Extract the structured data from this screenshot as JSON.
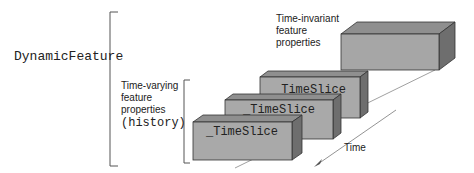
{
  "diagram": {
    "root_label": "DynamicFeature",
    "invariant": {
      "label_lines": [
        "Time-invariant",
        "feature",
        "properties"
      ]
    },
    "varying": {
      "label_lines": [
        "Time-varying",
        "feature",
        "properties"
      ],
      "label_mono": "(history)"
    },
    "timeslices": [
      {
        "label": "_TimeSlice"
      },
      {
        "label": "_TimeSlice"
      },
      {
        "label": "_TimeSlice"
      }
    ],
    "axis_label": "Time",
    "colors": {
      "box_front": "#a9a9a9",
      "box_top": "#8a8a8a",
      "box_side": "#6e6e6e",
      "outline": "#333333",
      "bracket": "#555555"
    }
  }
}
